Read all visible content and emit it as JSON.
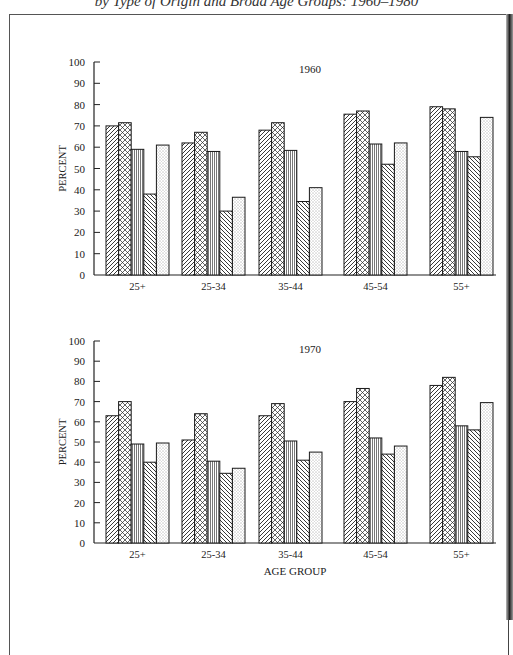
{
  "page": {
    "title_fragment": "by Type of Origin and Broad Age Groups: 1960–1980"
  },
  "chart_data": [
    {
      "type": "bar",
      "title": "1960",
      "xlabel": "",
      "ylabel": "PERCENT",
      "ylim": [
        0,
        100
      ],
      "yticks": [
        0,
        10,
        20,
        30,
        40,
        50,
        60,
        70,
        80,
        90,
        100
      ],
      "categories": [
        "25+",
        "25-34",
        "35-44",
        "45-54",
        "55+"
      ],
      "series": [
        {
          "name": "series-1 (diagonal hatch /)",
          "pattern": "diag-right",
          "values": [
            70,
            62,
            68,
            75.5,
            79
          ]
        },
        {
          "name": "series-2 (cross-hatch)",
          "pattern": "crosshatch",
          "values": [
            71.5,
            67,
            71.5,
            77,
            78
          ]
        },
        {
          "name": "series-3 (vertical lines)",
          "pattern": "vertical",
          "values": [
            59,
            58,
            58.5,
            61.5,
            58
          ]
        },
        {
          "name": "series-4 (diagonal hatch \\)",
          "pattern": "diag-left",
          "values": [
            38,
            30,
            34.5,
            52,
            55.5
          ]
        },
        {
          "name": "series-5 (dots)",
          "pattern": "dots",
          "values": [
            61,
            36.5,
            41,
            62,
            74
          ]
        }
      ],
      "grid": false,
      "legend": "none visible"
    },
    {
      "type": "bar",
      "title": "1970",
      "xlabel": "AGE GROUP",
      "ylabel": "PERCENT",
      "ylim": [
        0,
        100
      ],
      "yticks": [
        0,
        10,
        20,
        30,
        40,
        50,
        60,
        70,
        80,
        90,
        100
      ],
      "categories": [
        "25+",
        "25-34",
        "35-44",
        "45-54",
        "55+"
      ],
      "series": [
        {
          "name": "series-1 (diagonal hatch /)",
          "pattern": "diag-right",
          "values": [
            63,
            51,
            63,
            70,
            78
          ]
        },
        {
          "name": "series-2 (cross-hatch)",
          "pattern": "crosshatch",
          "values": [
            70,
            64,
            69,
            76.5,
            82
          ]
        },
        {
          "name": "series-3 (vertical lines)",
          "pattern": "vertical",
          "values": [
            49,
            40.5,
            50.5,
            52,
            58
          ]
        },
        {
          "name": "series-4 (diagonal hatch \\)",
          "pattern": "diag-left",
          "values": [
            40,
            34.5,
            41,
            44,
            56
          ]
        },
        {
          "name": "series-5 (dots)",
          "pattern": "dots",
          "values": [
            49.5,
            37,
            45,
            48,
            69.5
          ]
        }
      ],
      "grid": false,
      "legend": "none visible"
    }
  ],
  "layout": {
    "panels": [
      {
        "axis_left": 94,
        "axis_right": 496,
        "y_top": 62,
        "y_zero": 275,
        "title_x": 310,
        "title_y": 73,
        "cat_label_y": 290
      },
      {
        "axis_left": 94,
        "axis_right": 496,
        "y_top": 341,
        "y_zero": 543,
        "title_x": 310,
        "title_y": 353,
        "cat_label_y": 558,
        "xlabel_y": 575
      }
    ],
    "group_starts": [
      106,
      182,
      259,
      344,
      430
    ],
    "bar_width": 12.6,
    "tick_label_x": 85,
    "ylabel_x": 66
  }
}
